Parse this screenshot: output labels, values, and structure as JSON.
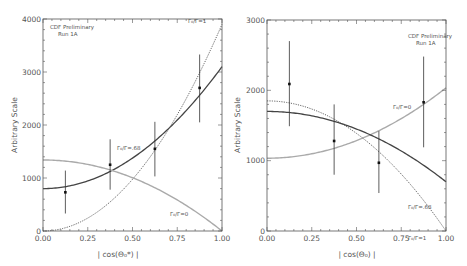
{
  "colors": {
    "frame": "#555555",
    "data": "#111111",
    "curve_solid": "#444444",
    "curve_dotted": "#555555",
    "curve_grey": "#aaaaaa",
    "text": "#555555"
  },
  "chart_data": [
    {
      "type": "scatter",
      "title": "",
      "annotation": [
        "CDF Preliminary",
        "Run 1A"
      ],
      "xlabel": "| cos(Θ₀*) |",
      "ylabel": "Arbitrary Scale",
      "xlim": [
        0,
        1
      ],
      "ylim": [
        0,
        4000
      ],
      "xticks": [
        "0.00",
        "0.25",
        "0.50",
        "0.75",
        "1.00"
      ],
      "yticks": [
        "0",
        "1000",
        "2000",
        "3000",
        "4000"
      ],
      "grid": false,
      "legend_position": "inline curve labels",
      "data_points": {
        "x": [
          0.125,
          0.375,
          0.625,
          0.875
        ],
        "y": [
          730,
          1250,
          1550,
          2700
        ],
        "err_low": [
          330,
          780,
          1030,
          2050
        ],
        "err_high": [
          1140,
          1730,
          2060,
          3330
        ]
      },
      "series": [
        {
          "name": "Γ₀/Γ=.68",
          "style": "solid",
          "label_text": "Γ₀/Γ=.68",
          "formula": {
            "a": 800,
            "b": 2300
          }
        },
        {
          "name": "Γ₀/Γ=1",
          "style": "dotted",
          "label_text": "Γ₀/Γ=1",
          "formula": {
            "a": 0,
            "b": 3900
          }
        },
        {
          "name": "Γ₀/Γ=0",
          "style": "grey",
          "label_text": "Γ₀/Γ=0",
          "formula": {
            "a": 1340,
            "b": -1340
          }
        }
      ]
    },
    {
      "type": "scatter",
      "title": "",
      "annotation": [
        "CDF Preliminary",
        "Run 1A"
      ],
      "xlabel": "| cos(Θ₀) |",
      "ylabel": "Arbitrary Scale",
      "xlim": [
        0,
        1
      ],
      "ylim": [
        0,
        3000
      ],
      "xticks": [
        "0.00",
        "0.25",
        "0.50",
        "0.75",
        "1.00"
      ],
      "yticks": [
        "0",
        "1000",
        "2000",
        "3000"
      ],
      "grid": false,
      "legend_position": "inline curve labels",
      "data_points": {
        "x": [
          0.125,
          0.375,
          0.625,
          0.875
        ],
        "y": [
          2090,
          1280,
          970,
          1830
        ],
        "err_low": [
          1490,
          800,
          540,
          1190
        ],
        "err_high": [
          2700,
          1800,
          1420,
          2480
        ]
      },
      "series": [
        {
          "name": "Γ₀/Γ=0",
          "style": "grey",
          "label_text": "Γ₀/Γ=0",
          "formula": {
            "a": 1035,
            "b": 1000
          }
        },
        {
          "name": "Γ₀/Γ=.68",
          "style": "solid",
          "label_text": "Γ₀/Γ=.68",
          "formula": {
            "a": 1700,
            "b": -1000
          }
        },
        {
          "name": "Γ₀/Γ=1",
          "style": "dotted",
          "label_text": "Γ₀/Γ=1",
          "formula": {
            "a": 1850,
            "b": -1850
          }
        }
      ]
    }
  ],
  "panels_layout": [
    {
      "frame": {
        "x0": 43,
        "x1": 222,
        "y_top": 19,
        "y_bottom": 231
      },
      "annotation_pos": {
        "x": 50,
        "y": 29
      },
      "curve_label_pos": [
        {
          "x": 117,
          "y": 150
        },
        {
          "x": 188,
          "y": 23
        },
        {
          "x": 170,
          "y": 216
        }
      ],
      "xlabel_pos": {
        "x": 118,
        "y": 257
      },
      "ylabel_pos": {
        "x": 17,
        "y": 125
      }
    },
    {
      "frame": {
        "x0": 267,
        "x1": 446,
        "y_top": 20,
        "y_bottom": 231
      },
      "annotation_pos": {
        "x": 408,
        "y": 38
      },
      "curve_label_pos": [
        {
          "x": 393,
          "y": 109
        },
        {
          "x": 408,
          "y": 209
        },
        {
          "x": 408,
          "y": 240
        }
      ],
      "xlabel_pos": {
        "x": 357,
        "y": 257
      },
      "ylabel_pos": {
        "x": 240,
        "y": 125
      }
    }
  ]
}
